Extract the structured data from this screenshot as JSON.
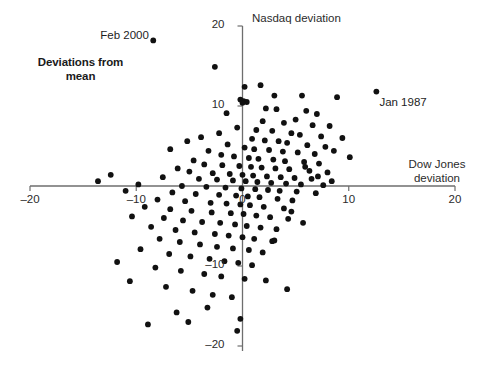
{
  "figure": {
    "title_line1": "Deviations from",
    "title_line2": "mean",
    "background": "#ffffff",
    "axis_color": "#6e6e6e",
    "point_color": "#111111"
  },
  "chart_data": {
    "type": "scatter",
    "title": "Deviations from mean",
    "xlabel": "Dow Jones deviation",
    "ylabel": "Nasdaq deviation",
    "xlim": [
      -20,
      20
    ],
    "ylim": [
      -20,
      20
    ],
    "xticks": [
      -20,
      -10,
      0,
      10,
      20
    ],
    "xtick_labels": [
      "–20",
      "–10",
      "0",
      "10",
      "20"
    ],
    "yticks": [
      -20,
      -10,
      0,
      10,
      20
    ],
    "ytick_labels": [
      "–20",
      "–10",
      "0",
      "10",
      "20"
    ],
    "grid": false,
    "legend": null,
    "annotations": [
      {
        "text": "Feb 2000",
        "x": -8.4,
        "y": 18.2,
        "anchor": "right"
      },
      {
        "text": "Jan 1987",
        "x": 12.6,
        "y": 11.8,
        "anchor": "left"
      }
    ],
    "series": [
      {
        "name": "Monthly deviations",
        "marker": "circle",
        "color": "#111111",
        "points": [
          [
            -8.4,
            18.2
          ],
          [
            -2.6,
            14.9
          ],
          [
            1.7,
            12.6
          ],
          [
            12.6,
            11.8
          ],
          [
            0.1,
            10.6
          ],
          [
            0.4,
            10.5
          ],
          [
            3.0,
            11.3
          ],
          [
            5.6,
            11.3
          ],
          [
            8.9,
            11.1
          ],
          [
            2.2,
            9.7
          ],
          [
            3.2,
            9.6
          ],
          [
            6.0,
            9.4
          ],
          [
            7.0,
            9.0
          ],
          [
            5.0,
            8.3
          ],
          [
            1.9,
            8.1
          ],
          [
            3.9,
            7.9
          ],
          [
            6.6,
            7.6
          ],
          [
            8.2,
            7.5
          ],
          [
            -0.5,
            7.3
          ],
          [
            1.3,
            7.0
          ],
          [
            2.8,
            6.9
          ],
          [
            4.6,
            6.6
          ],
          [
            5.4,
            6.4
          ],
          [
            7.4,
            6.2
          ],
          [
            9.4,
            6.0
          ],
          [
            0.9,
            5.9
          ],
          [
            2.1,
            5.7
          ],
          [
            3.4,
            5.6
          ],
          [
            4.2,
            5.4
          ],
          [
            6.1,
            5.1
          ],
          [
            7.8,
            4.9
          ],
          [
            -1.4,
            5.2
          ],
          [
            0.2,
            4.8
          ],
          [
            1.1,
            4.6
          ],
          [
            2.5,
            4.5
          ],
          [
            3.8,
            4.3
          ],
          [
            5.2,
            4.2
          ],
          [
            6.8,
            4.0
          ],
          [
            8.6,
            4.4
          ],
          [
            10.1,
            3.6
          ],
          [
            -3.2,
            4.4
          ],
          [
            -2.0,
            3.9
          ],
          [
            -0.8,
            3.7
          ],
          [
            0.6,
            3.5
          ],
          [
            1.5,
            3.4
          ],
          [
            2.9,
            3.3
          ],
          [
            4.0,
            3.1
          ],
          [
            5.8,
            3.0
          ],
          [
            7.2,
            2.8
          ],
          [
            -4.6,
            3.2
          ],
          [
            -3.6,
            2.7
          ],
          [
            -1.9,
            2.6
          ],
          [
            -0.3,
            2.5
          ],
          [
            0.8,
            2.4
          ],
          [
            1.8,
            2.3
          ],
          [
            3.1,
            2.2
          ],
          [
            4.4,
            2.1
          ],
          [
            6.3,
            1.9
          ],
          [
            8.0,
            1.7
          ],
          [
            -6.1,
            2.2
          ],
          [
            -5.0,
            1.8
          ],
          [
            -2.8,
            1.6
          ],
          [
            -1.2,
            1.5
          ],
          [
            0.0,
            1.4
          ],
          [
            1.0,
            1.3
          ],
          [
            2.3,
            1.2
          ],
          [
            3.6,
            1.1
          ],
          [
            4.9,
            1.0
          ],
          [
            6.5,
            0.9
          ],
          [
            -7.5,
            1.1
          ],
          [
            -4.1,
            0.9
          ],
          [
            -2.4,
            0.8
          ],
          [
            -0.9,
            0.7
          ],
          [
            0.3,
            0.6
          ],
          [
            1.4,
            0.5
          ],
          [
            2.7,
            0.4
          ],
          [
            4.1,
            0.3
          ],
          [
            5.5,
            0.2
          ],
          [
            7.6,
            0.1
          ],
          [
            -9.8,
            0.2
          ],
          [
            -5.7,
            0.0
          ],
          [
            -3.4,
            -0.1
          ],
          [
            -1.6,
            -0.2
          ],
          [
            -0.1,
            -0.3
          ],
          [
            1.2,
            -0.4
          ],
          [
            2.4,
            -0.5
          ],
          [
            3.5,
            -0.6
          ],
          [
            5.1,
            -0.7
          ],
          [
            6.9,
            -0.9
          ],
          [
            -11.0,
            -0.6
          ],
          [
            -6.6,
            -0.8
          ],
          [
            -4.4,
            -1.0
          ],
          [
            -2.2,
            -1.1
          ],
          [
            -0.6,
            -1.2
          ],
          [
            0.5,
            -1.3
          ],
          [
            1.6,
            -1.4
          ],
          [
            3.3,
            -1.6
          ],
          [
            4.7,
            -1.8
          ],
          [
            -8.0,
            -1.7
          ],
          [
            -5.4,
            -1.9
          ],
          [
            -3.0,
            -2.1
          ],
          [
            -1.5,
            -2.2
          ],
          [
            -0.2,
            -2.3
          ],
          [
            0.7,
            -2.4
          ],
          [
            2.0,
            -2.6
          ],
          [
            3.9,
            -2.8
          ],
          [
            -9.2,
            -2.6
          ],
          [
            -6.8,
            -2.9
          ],
          [
            -4.8,
            -3.1
          ],
          [
            -2.9,
            -3.3
          ],
          [
            -1.1,
            -3.4
          ],
          [
            0.1,
            -3.5
          ],
          [
            1.3,
            -3.7
          ],
          [
            2.6,
            -3.9
          ],
          [
            4.3,
            -4.1
          ],
          [
            -10.4,
            -3.8
          ],
          [
            -7.4,
            -4.0
          ],
          [
            -5.6,
            -4.3
          ],
          [
            -3.8,
            -4.5
          ],
          [
            -2.1,
            -4.6
          ],
          [
            -0.7,
            -4.8
          ],
          [
            0.4,
            -5.0
          ],
          [
            1.7,
            -5.2
          ],
          [
            3.2,
            -5.4
          ],
          [
            -8.6,
            -5.1
          ],
          [
            -6.3,
            -5.5
          ],
          [
            -4.5,
            -5.8
          ],
          [
            -2.6,
            -6.0
          ],
          [
            -1.3,
            -6.2
          ],
          [
            0.0,
            -6.4
          ],
          [
            1.1,
            -6.6
          ],
          [
            2.8,
            -6.9
          ],
          [
            -7.8,
            -6.6
          ],
          [
            -5.9,
            -7.0
          ],
          [
            -4.0,
            -7.3
          ],
          [
            -2.4,
            -7.6
          ],
          [
            -0.9,
            -7.8
          ],
          [
            0.6,
            -8.0
          ],
          [
            1.9,
            -8.3
          ],
          [
            -9.6,
            -7.9
          ],
          [
            -6.9,
            -8.5
          ],
          [
            -4.9,
            -8.8
          ],
          [
            -3.1,
            -9.1
          ],
          [
            -1.7,
            -9.4
          ],
          [
            -0.4,
            -9.6
          ],
          [
            0.9,
            -9.9
          ],
          [
            -11.8,
            -9.5
          ],
          [
            -8.2,
            -10.2
          ],
          [
            -5.8,
            -10.6
          ],
          [
            -3.6,
            -11.0
          ],
          [
            -2.0,
            -11.3
          ],
          [
            0.2,
            -11.6
          ],
          [
            2.2,
            -11.8
          ],
          [
            -10.6,
            -11.9
          ],
          [
            -7.2,
            -12.6
          ],
          [
            -4.7,
            -13.1
          ],
          [
            -2.8,
            -13.6
          ],
          [
            -1.0,
            -13.9
          ],
          [
            -3.3,
            -15.2
          ],
          [
            -6.2,
            -15.8
          ],
          [
            -0.2,
            -16.6
          ],
          [
            -8.9,
            -17.3
          ],
          [
            -5.1,
            -17.0
          ],
          [
            -1.5,
            9.1
          ],
          [
            -2.2,
            6.6
          ],
          [
            -3.9,
            6.1
          ],
          [
            -5.2,
            5.6
          ],
          [
            -6.8,
            4.6
          ],
          [
            -12.4,
            1.4
          ],
          [
            -13.6,
            0.6
          ],
          [
            0.2,
            12.4
          ],
          [
            -0.2,
            10.8
          ],
          [
            0.0,
            10.4
          ],
          [
            5.9,
            2.4
          ],
          [
            7.1,
            1.2
          ],
          [
            8.4,
            0.6
          ],
          [
            4.6,
            -3.2
          ],
          [
            5.7,
            -4.6
          ],
          [
            3.0,
            -6.8
          ],
          [
            -0.5,
            -18.1
          ],
          [
            4.2,
            -12.9
          ]
        ]
      }
    ]
  }
}
